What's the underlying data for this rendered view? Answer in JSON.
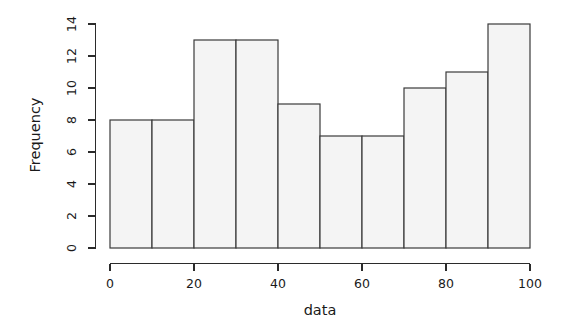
{
  "chart_data": {
    "type": "bar",
    "subtype": "histogram",
    "title": "",
    "xlabel": "data",
    "ylabel": "Frequency",
    "categories": [
      "0-10",
      "10-20",
      "20-30",
      "30-40",
      "40-50",
      "50-60",
      "60-70",
      "70-80",
      "80-90",
      "90-100"
    ],
    "bin_edges": [
      0,
      10,
      20,
      30,
      40,
      50,
      60,
      70,
      80,
      90,
      100
    ],
    "values": [
      8,
      8,
      13,
      13,
      9,
      7,
      7,
      10,
      11,
      14
    ],
    "xlim": [
      0,
      100
    ],
    "ylim": [
      0,
      14
    ],
    "xticks": [
      0,
      20,
      40,
      60,
      80,
      100
    ],
    "yticks": [
      0,
      2,
      4,
      6,
      8,
      10,
      12,
      14
    ],
    "xtick_labels": [
      "0",
      "20",
      "40",
      "60",
      "80",
      "100"
    ],
    "ytick_labels": [
      "0",
      "2",
      "4",
      "6",
      "8",
      "10",
      "12",
      "14"
    ],
    "grid": false,
    "legend": false,
    "bar_fill_color": "#f4f4f4",
    "bar_border_color": "#3a3a3a",
    "axis_color": "#2b2b2b",
    "background_color": "#ffffff",
    "ylabel_rotation": -90,
    "ytick_label_rotation": -90
  },
  "figure": {
    "width": 566,
    "height": 336
  }
}
